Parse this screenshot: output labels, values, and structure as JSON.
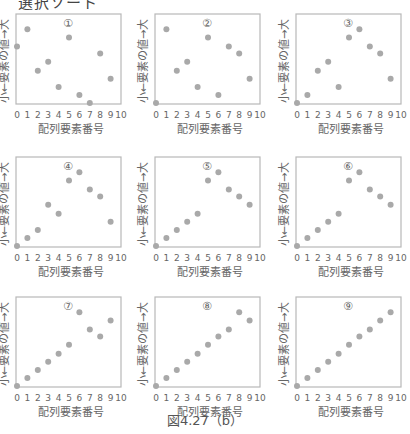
{
  "header": {
    "title": "選択ソート"
  },
  "caption": "図4.27（b）",
  "style": {
    "point_color": "#a9a9a9",
    "frame_color": "#b8b8b8",
    "text_color": "#666666"
  },
  "chart_data": [
    {
      "type": "scatter",
      "panel_label": "①",
      "xlabel": "配列要素番号",
      "ylabel": "小←要素の値→大",
      "x": [
        0,
        1,
        2,
        3,
        4,
        5,
        6,
        7,
        8,
        9
      ],
      "y": [
        6.4,
        8.3,
        3.7,
        4.7,
        1.9,
        7.4,
        1.0,
        0.1,
        5.6,
        2.8
      ],
      "xticks": [
        0,
        1,
        2,
        3,
        4,
        5,
        6,
        7,
        8,
        9,
        10
      ],
      "xlim": [
        0,
        10
      ],
      "ylim": [
        0,
        10
      ]
    },
    {
      "type": "scatter",
      "panel_label": "②",
      "xlabel": "配列要素番号",
      "ylabel": "小←要素の値→大",
      "x": [
        0,
        1,
        2,
        3,
        4,
        5,
        6,
        7,
        8,
        9
      ],
      "y": [
        0.1,
        8.3,
        3.7,
        4.7,
        1.9,
        7.4,
        1.0,
        6.4,
        5.6,
        2.8
      ],
      "xticks": [
        0,
        1,
        2,
        3,
        4,
        5,
        6,
        7,
        8,
        9,
        10
      ],
      "xlim": [
        0,
        10
      ],
      "ylim": [
        0,
        10
      ]
    },
    {
      "type": "scatter",
      "panel_label": "③",
      "xlabel": "配列要素番号",
      "ylabel": "小←要素の値→大",
      "x": [
        0,
        1,
        2,
        3,
        4,
        5,
        6,
        7,
        8,
        9
      ],
      "y": [
        0.1,
        1.0,
        3.7,
        4.7,
        1.9,
        7.4,
        8.3,
        6.4,
        5.6,
        2.8
      ],
      "xticks": [
        0,
        1,
        2,
        3,
        4,
        5,
        6,
        7,
        8,
        9,
        10
      ],
      "xlim": [
        0,
        10
      ],
      "ylim": [
        0,
        10
      ]
    },
    {
      "type": "scatter",
      "panel_label": "④",
      "xlabel": "配列要素番号",
      "ylabel": "小←要素の値→大",
      "x": [
        0,
        1,
        2,
        3,
        4,
        5,
        6,
        7,
        8,
        9
      ],
      "y": [
        0.1,
        1.0,
        1.9,
        4.7,
        3.7,
        7.4,
        8.3,
        6.4,
        5.6,
        2.8
      ],
      "xticks": [
        0,
        1,
        2,
        3,
        4,
        5,
        6,
        7,
        8,
        9,
        10
      ],
      "xlim": [
        0,
        10
      ],
      "ylim": [
        0,
        10
      ]
    },
    {
      "type": "scatter",
      "panel_label": "⑤",
      "xlabel": "配列要素番号",
      "ylabel": "小←要素の値→大",
      "x": [
        0,
        1,
        2,
        3,
        4,
        5,
        6,
        7,
        8,
        9
      ],
      "y": [
        0.1,
        1.0,
        1.9,
        2.8,
        3.7,
        7.4,
        8.3,
        6.4,
        5.6,
        4.7
      ],
      "xticks": [
        0,
        1,
        2,
        3,
        4,
        5,
        6,
        7,
        8,
        9,
        10
      ],
      "xlim": [
        0,
        10
      ],
      "ylim": [
        0,
        10
      ]
    },
    {
      "type": "scatter",
      "panel_label": "⑥",
      "xlabel": "配列要素番号",
      "ylabel": "小←要素の値→大",
      "x": [
        0,
        1,
        2,
        3,
        4,
        5,
        6,
        7,
        8,
        9
      ],
      "y": [
        0.1,
        1.0,
        1.9,
        2.8,
        3.7,
        7.4,
        8.3,
        6.4,
        5.6,
        4.7
      ],
      "xticks": [
        0,
        1,
        2,
        3,
        4,
        5,
        6,
        7,
        8,
        9,
        10
      ],
      "xlim": [
        0,
        10
      ],
      "ylim": [
        0,
        10
      ]
    },
    {
      "type": "scatter",
      "panel_label": "⑦",
      "xlabel": "配列要素番号",
      "ylabel": "小←要素の値→大",
      "x": [
        0,
        1,
        2,
        3,
        4,
        5,
        6,
        7,
        8,
        9
      ],
      "y": [
        0.1,
        1.0,
        1.9,
        2.8,
        3.7,
        4.7,
        8.3,
        6.4,
        5.6,
        7.4
      ],
      "xticks": [
        0,
        1,
        2,
        3,
        4,
        5,
        6,
        7,
        8,
        9,
        10
      ],
      "xlim": [
        0,
        10
      ],
      "ylim": [
        0,
        10
      ]
    },
    {
      "type": "scatter",
      "panel_label": "⑧",
      "xlabel": "配列要素番号",
      "ylabel": "小←要素の値→大",
      "x": [
        0,
        1,
        2,
        3,
        4,
        5,
        6,
        7,
        8,
        9
      ],
      "y": [
        0.1,
        1.0,
        1.9,
        2.8,
        3.7,
        4.7,
        5.6,
        6.4,
        8.3,
        7.4
      ],
      "xticks": [
        0,
        1,
        2,
        3,
        4,
        5,
        6,
        7,
        8,
        9,
        10
      ],
      "xlim": [
        0,
        10
      ],
      "ylim": [
        0,
        10
      ]
    },
    {
      "type": "scatter",
      "panel_label": "⑨",
      "xlabel": "配列要素番号",
      "ylabel": "小←要素の値→大",
      "x": [
        0,
        1,
        2,
        3,
        4,
        5,
        6,
        7,
        8,
        9
      ],
      "y": [
        0.1,
        1.0,
        1.9,
        2.8,
        3.7,
        4.7,
        5.6,
        6.4,
        7.4,
        8.3
      ],
      "xticks": [
        0,
        1,
        2,
        3,
        4,
        5,
        6,
        7,
        8,
        9,
        10
      ],
      "xlim": [
        0,
        10
      ],
      "ylim": [
        0,
        10
      ]
    }
  ]
}
